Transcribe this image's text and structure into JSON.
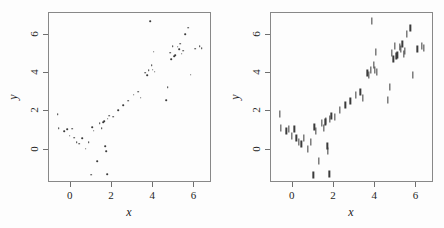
{
  "figure": {
    "panels": [
      {
        "name": "left-panel",
        "marker": "dot",
        "xlabel": "x",
        "ylabel": "y"
      },
      {
        "name": "right-panel",
        "marker": "vertical-bar",
        "xlabel": "x",
        "ylabel": "y"
      }
    ],
    "axis": {
      "x_ticks": [
        0,
        2,
        4,
        6
      ],
      "y_ticks": [
        0,
        2,
        4,
        6
      ],
      "x_tick_labels": [
        "0",
        "2",
        "4",
        "6"
      ],
      "y_tick_labels": [
        "0",
        "2",
        "4",
        "6"
      ],
      "xlim": [
        -1.05,
        6.85
      ],
      "ylim": [
        -1.75,
        7.15
      ]
    },
    "colors": {
      "marker": "#3b3b3b",
      "frame": "#888888",
      "text": "#1f1f1f",
      "background": "#fdfdfd"
    }
  },
  "chart_data": [
    {
      "type": "scatter",
      "title": "",
      "xlabel": "x",
      "ylabel": "y",
      "xlim": [
        -1.05,
        6.85
      ],
      "ylim": [
        -1.75,
        7.15
      ],
      "xticks": [
        0,
        2,
        4,
        6
      ],
      "yticks": [
        0,
        2,
        4,
        6
      ],
      "grid": false,
      "legend": false,
      "marker": "point",
      "series": [
        {
          "name": "sample",
          "x": [
            -0.62,
            -0.58,
            -0.3,
            -0.18,
            -0.05,
            0.08,
            0.18,
            0.3,
            0.42,
            0.55,
            0.72,
            0.88,
            1.0,
            1.05,
            1.12,
            1.28,
            1.4,
            1.5,
            1.58,
            1.62,
            1.68,
            1.72,
            1.78,
            1.8,
            1.88,
            2.05,
            2.3,
            2.55,
            2.8,
            3.05,
            3.28,
            3.4,
            3.62,
            3.7,
            3.78,
            3.85,
            3.92,
            3.98,
            4.02,
            4.08,
            4.62,
            4.7,
            4.82,
            4.88,
            4.95,
            5.02,
            5.08,
            5.18,
            5.25,
            5.32,
            5.38,
            5.45,
            5.55,
            5.7,
            5.82,
            6.05,
            6.25,
            6.35
          ],
          "y": [
            1.85,
            1.12,
            0.95,
            1.08,
            0.72,
            1.1,
            0.62,
            0.38,
            0.3,
            0.58,
            0.05,
            0.38,
            -1.32,
            1.18,
            0.98,
            -0.62,
            1.38,
            1.12,
            1.42,
            1.48,
            0.18,
            -0.08,
            -1.3,
            1.62,
            1.78,
            1.72,
            2.05,
            2.32,
            2.55,
            2.88,
            3.02,
            2.72,
            4.02,
            3.88,
            4.15,
            6.72,
            4.42,
            4.18,
            5.12,
            4.08,
            2.58,
            3.28,
            5.08,
            4.72,
            5.42,
            4.88,
            4.95,
            5.38,
            5.25,
            5.55,
            5.02,
            5.18,
            6.05,
            6.38,
            3.92,
            5.28,
            5.42,
            5.3
          ]
        }
      ]
    },
    {
      "type": "scatter",
      "title": "",
      "xlabel": "x",
      "ylabel": "y",
      "xlim": [
        -1.05,
        6.85
      ],
      "ylim": [
        -1.75,
        7.15
      ],
      "xticks": [
        0,
        2,
        4,
        6
      ],
      "yticks": [
        0,
        2,
        4,
        6
      ],
      "grid": false,
      "legend": false,
      "marker": "vertical-tick",
      "series": [
        {
          "name": "sample",
          "x": [
            -0.62,
            -0.58,
            -0.3,
            -0.18,
            -0.05,
            0.08,
            0.18,
            0.3,
            0.42,
            0.55,
            0.72,
            0.88,
            1.0,
            1.05,
            1.12,
            1.28,
            1.4,
            1.5,
            1.58,
            1.62,
            1.68,
            1.72,
            1.78,
            1.8,
            1.88,
            2.05,
            2.3,
            2.55,
            2.8,
            3.05,
            3.28,
            3.4,
            3.62,
            3.7,
            3.78,
            3.85,
            3.92,
            3.98,
            4.02,
            4.08,
            4.62,
            4.7,
            4.82,
            4.88,
            4.95,
            5.02,
            5.08,
            5.18,
            5.25,
            5.32,
            5.38,
            5.45,
            5.55,
            5.7,
            5.82,
            6.05,
            6.25,
            6.35
          ],
          "y": [
            1.85,
            1.12,
            0.95,
            1.08,
            0.72,
            1.1,
            0.62,
            0.38,
            0.3,
            0.58,
            0.05,
            0.38,
            -1.32,
            1.18,
            0.98,
            -0.62,
            1.38,
            1.12,
            1.42,
            1.48,
            0.18,
            -0.08,
            -1.3,
            1.62,
            1.78,
            1.72,
            2.05,
            2.32,
            2.55,
            2.88,
            3.02,
            2.72,
            4.02,
            3.88,
            4.15,
            6.72,
            4.42,
            4.18,
            5.12,
            4.08,
            2.58,
            3.28,
            5.08,
            4.72,
            5.42,
            4.88,
            4.95,
            5.38,
            5.25,
            5.55,
            5.02,
            5.18,
            6.05,
            6.38,
            3.92,
            5.28,
            5.42,
            5.3
          ]
        }
      ]
    }
  ]
}
